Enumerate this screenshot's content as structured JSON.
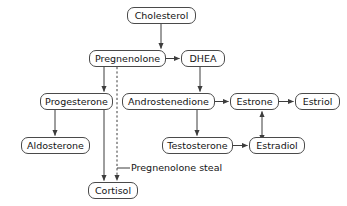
{
  "diagram": {
    "colors": {
      "background": "#ffffff",
      "node_border": "#4a4a4a",
      "node_fill": "#ffffff",
      "text": "#141414",
      "edge": "#3d3d3d"
    },
    "nodes": [
      {
        "id": "cholesterol",
        "label": "Cholesterol",
        "x": 127,
        "y": 7,
        "w": 69,
        "h": 17,
        "font_size": 9.5
      },
      {
        "id": "pregnenolone",
        "label": "Pregnenolone",
        "x": 89,
        "y": 50,
        "w": 77,
        "h": 17,
        "font_size": 9.5
      },
      {
        "id": "dhea",
        "label": "DHEA",
        "x": 181,
        "y": 50,
        "w": 44,
        "h": 17,
        "font_size": 9.5
      },
      {
        "id": "progesterone",
        "label": "Progesterone",
        "x": 40,
        "y": 93,
        "w": 73,
        "h": 17,
        "font_size": 9.5
      },
      {
        "id": "androstenedione",
        "label": "Androstenedione",
        "x": 122,
        "y": 93,
        "w": 93,
        "h": 17,
        "font_size": 9.5
      },
      {
        "id": "estrone",
        "label": "Estrone",
        "x": 230,
        "y": 93,
        "w": 49,
        "h": 17,
        "font_size": 9.5
      },
      {
        "id": "estriol",
        "label": "Estriol",
        "x": 295,
        "y": 93,
        "w": 45,
        "h": 17,
        "font_size": 9.5
      },
      {
        "id": "aldosterone",
        "label": "Aldosterone",
        "x": 21,
        "y": 137,
        "w": 69,
        "h": 17,
        "font_size": 9.5
      },
      {
        "id": "testosterone",
        "label": "Testosterone",
        "x": 162,
        "y": 137,
        "w": 71,
        "h": 17,
        "font_size": 9.5
      },
      {
        "id": "estradiol",
        "label": "Estradiol",
        "x": 249,
        "y": 137,
        "w": 56,
        "h": 17,
        "font_size": 9.5
      },
      {
        "id": "cortisol",
        "label": "Cortisol",
        "x": 88,
        "y": 182,
        "w": 50,
        "h": 17,
        "font_size": 9.5
      }
    ],
    "annotations": [
      {
        "id": "pregnenolone-steal",
        "label": "Pregnenolone steal",
        "x": 131,
        "y": 163,
        "font_size": 9.5
      }
    ],
    "edges": [
      {
        "id": "cholesterol-to-pregnenolone",
        "from": "cholesterol",
        "to": "pregnenolone",
        "style": "solid",
        "arrow": "end"
      },
      {
        "id": "pregnenolone-to-dhea",
        "from": "pregnenolone",
        "to": "dhea",
        "style": "solid",
        "arrow": "end"
      },
      {
        "id": "pregnenolone-to-progesterone",
        "from": "pregnenolone",
        "to": "progesterone",
        "style": "solid",
        "arrow": "end"
      },
      {
        "id": "pregnenolone-to-cortisol",
        "from": "pregnenolone",
        "to": "cortisol",
        "style": "solid",
        "arrow": "end"
      },
      {
        "id": "pregnenolone-steal-to-cortisol",
        "from": "pregnenolone",
        "to": "cortisol",
        "style": "dashed",
        "arrow": "end"
      },
      {
        "id": "dhea-to-androstenedione",
        "from": "dhea",
        "to": "androstenedione",
        "style": "solid",
        "arrow": "end"
      },
      {
        "id": "progesterone-to-aldosterone",
        "from": "progesterone",
        "to": "aldosterone",
        "style": "solid",
        "arrow": "end"
      },
      {
        "id": "androstenedione-to-estrone",
        "from": "androstenedione",
        "to": "estrone",
        "style": "solid",
        "arrow": "end"
      },
      {
        "id": "androstenedione-to-testosterone",
        "from": "androstenedione",
        "to": "testosterone",
        "style": "solid",
        "arrow": "end"
      },
      {
        "id": "estrone-to-estriol",
        "from": "estrone",
        "to": "estriol",
        "style": "solid",
        "arrow": "end"
      },
      {
        "id": "testosterone-to-estradiol",
        "from": "testosterone",
        "to": "estradiol",
        "style": "solid",
        "arrow": "end"
      },
      {
        "id": "estradiol-estrone-reversible",
        "from": "estradiol",
        "to": "estrone",
        "style": "solid",
        "arrow": "both"
      }
    ]
  }
}
